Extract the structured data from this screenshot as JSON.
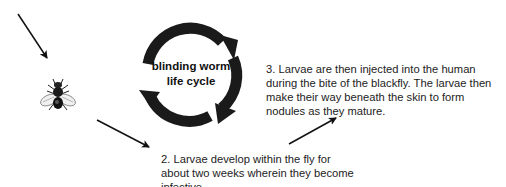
{
  "diagram": {
    "cycle": {
      "label_line1": "blinding worm",
      "label_line2": "life cycle",
      "color": "#1a1a1a"
    },
    "subject_icon": "blackfly-icon",
    "steps": [
      {
        "id": 2,
        "text": "2.  Larvae develop within the fly for about two weeks wherein they become infective."
      },
      {
        "id": 3,
        "text": "3.  Larvae are then injected into the human during the bite of the blackfly.  The larvae then make their way beneath the skin to form nodules as they mature."
      }
    ],
    "arrows": [
      {
        "name": "arrow-into-fly",
        "from": [
          18,
          14
        ],
        "to": [
          48,
          60
        ]
      },
      {
        "name": "arrow-fly-to-step2",
        "from": [
          97,
          120
        ],
        "to": [
          150,
          148
        ]
      },
      {
        "name": "arrow-step2-to-step3",
        "from": [
          289,
          144
        ],
        "to": [
          337,
          117
        ]
      }
    ]
  }
}
